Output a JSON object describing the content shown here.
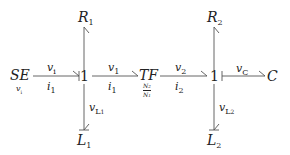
{
  "diagram": {
    "type": "bond-graph",
    "colors": {
      "line": "#555555",
      "text": "#222222",
      "background": "#ffffff"
    },
    "elements": {
      "source": {
        "name": "SE",
        "sub_label": "v",
        "sub_label_index": "i"
      },
      "junction1": {
        "label": "1"
      },
      "r1": {
        "name": "R",
        "index": "1"
      },
      "l1": {
        "name": "L",
        "index": "1"
      },
      "transformer": {
        "name": "TF",
        "ratio_num": "N",
        "ratio_num_index": "2",
        "ratio_den": "N",
        "ratio_den_index": "1"
      },
      "junction2": {
        "label": "1"
      },
      "r2": {
        "name": "R",
        "index": "2"
      },
      "l2": {
        "name": "L",
        "index": "2"
      },
      "capacitor": {
        "name": "C"
      }
    },
    "bonds": [
      {
        "id": "se-j1",
        "effort": "v",
        "effort_index": "i",
        "flow": "i",
        "flow_index": "1"
      },
      {
        "id": "j1-tf",
        "effort": "v",
        "effort_index": "1",
        "flow": "i",
        "flow_index": "1"
      },
      {
        "id": "j1-l1",
        "effort": "v",
        "effort_index": "L",
        "effort_index2": "1"
      },
      {
        "id": "tf-j2",
        "effort": "v",
        "effort_index": "2",
        "flow": "i",
        "flow_index": "2"
      },
      {
        "id": "j2-c",
        "effort": "v",
        "effort_index": "C"
      },
      {
        "id": "j2-l2",
        "effort": "v",
        "effort_index": "L",
        "effort_index2": "2"
      }
    ]
  }
}
